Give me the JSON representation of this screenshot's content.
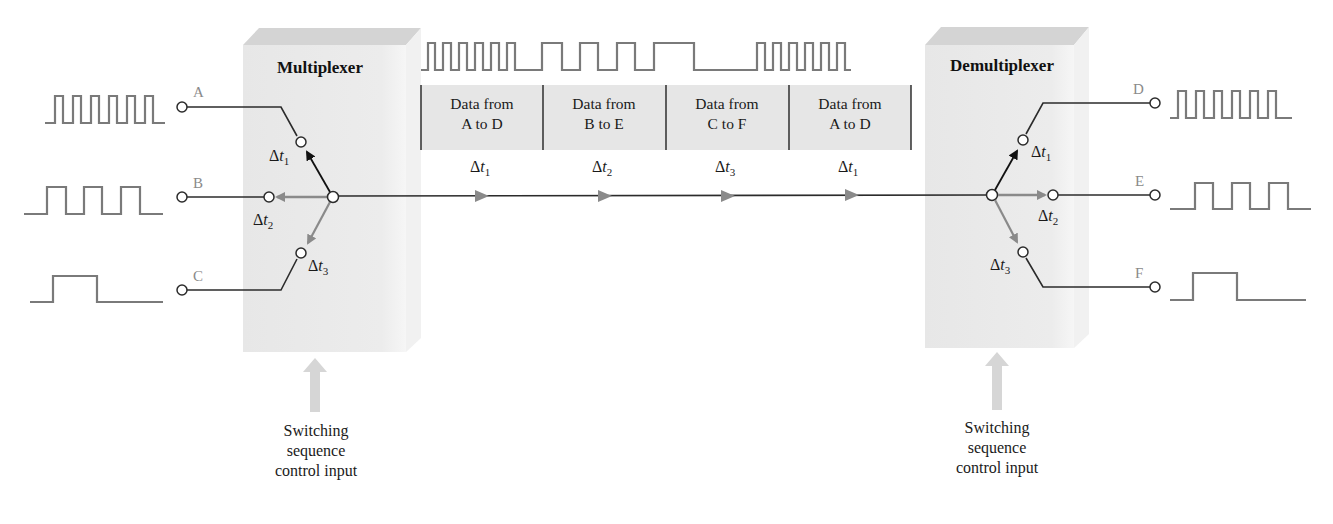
{
  "multiplexer": {
    "title": "Multiplexer",
    "inputs": [
      {
        "label": "A",
        "switch_time": "t",
        "switch_sub": "1",
        "pulses": 6
      },
      {
        "label": "B",
        "switch_time": "t",
        "switch_sub": "2",
        "pulses": 3
      },
      {
        "label": "C",
        "switch_time": "t",
        "switch_sub": "3",
        "pulses": 1
      }
    ],
    "control_input": [
      "Switching",
      "sequence",
      "control input"
    ]
  },
  "demultiplexer": {
    "title": "Demultiplexer",
    "outputs": [
      {
        "label": "D",
        "switch_time": "t",
        "switch_sub": "1",
        "pulses": 6
      },
      {
        "label": "E",
        "switch_time": "t",
        "switch_sub": "2",
        "pulses": 3
      },
      {
        "label": "F",
        "switch_time": "t",
        "switch_sub": "3",
        "pulses": 1
      }
    ],
    "control_input": [
      "Switching",
      "sequence",
      "control input"
    ]
  },
  "channel": {
    "frames": [
      {
        "line1": "Data from",
        "line2": "A to D",
        "slot": "t",
        "slot_sub": "1"
      },
      {
        "line1": "Data from",
        "line2": "B to E",
        "slot": "t",
        "slot_sub": "2"
      },
      {
        "line1": "Data from",
        "line2": "C to F",
        "slot": "t",
        "slot_sub": "3"
      },
      {
        "line1": "Data from",
        "line2": "A to D",
        "slot": "t",
        "slot_sub": "1"
      }
    ],
    "delta_symbol": "Δ"
  },
  "colors": {
    "box_fill": "#e9e9e9",
    "box_top": "#d2d2d2",
    "waveform": "#7a7a7a",
    "wire": "#2b2b2b",
    "arrow_gray": "#8a8a8a",
    "frame_fill": "#e6e6e6"
  }
}
